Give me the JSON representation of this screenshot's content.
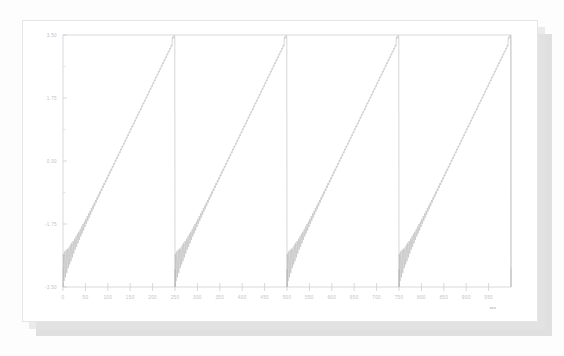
{
  "window": {
    "background_color": "#fdfdfd",
    "card_color": "#ffffff",
    "shadow_color": "#c9c9c9"
  },
  "chart_data": {
    "type": "line",
    "title": "",
    "subtitle": "",
    "xlabel": "ms",
    "ylabel": "",
    "grid": false,
    "legend": null,
    "line_color": "#b4b4b4",
    "frame_color": "#cfcfcf",
    "tick_label_color": "#c2c2c2",
    "xlim": [
      0,
      1000
    ],
    "ylim": [
      -3.5,
      3.5
    ],
    "xticks": [
      0,
      50,
      100,
      150,
      200,
      250,
      300,
      350,
      400,
      450,
      500,
      550,
      600,
      650,
      700,
      750,
      800,
      850,
      900,
      950
    ],
    "xtick_labels": [
      "0",
      "50",
      "100",
      "150",
      "200",
      "250",
      "300",
      "350",
      "400",
      "450",
      "500",
      "550",
      "600",
      "650",
      "700",
      "750",
      "800",
      "850",
      "900",
      "950"
    ],
    "yticks": [
      -3.5,
      -1.75,
      0.0,
      1.75,
      3.5
    ],
    "ytick_labels": [
      "-3.50",
      "-1.75",
      "0.00",
      "1.75",
      "3.50"
    ],
    "y_minor_ticks": [
      -2.625,
      -0.875,
      0.875,
      2.625
    ],
    "waveform": {
      "shape": "sawtooth",
      "period_ms": 250,
      "periods_shown": 4.2,
      "ramp_min": -3.0,
      "ramp_max": 3.4,
      "reset_peak": 3.5,
      "reset_trough": -3.5,
      "ripple": {
        "description": "damped high-frequency oscillation superimposed at the start of each ramp",
        "initial_amplitude": 0.42,
        "decay_constant_ms": 26,
        "frequency_hz": 320,
        "residual_amplitude": 0.035
      },
      "series": [
        {
          "name": "signal",
          "samples": 2000
        }
      ]
    }
  }
}
